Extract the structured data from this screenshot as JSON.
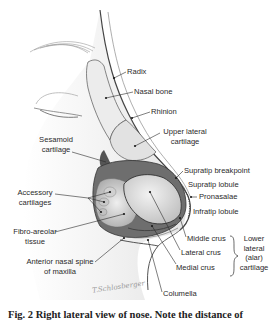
{
  "figure": {
    "caption": "Fig. 2 Right lateral view of nose. Note the distance of",
    "signature": "T.Schlosberger",
    "labels": {
      "radix": "Radix",
      "nasal_bone": "Nasal bone",
      "rhinion": "Rhinion",
      "upper_lateral_1": "Upper lateral",
      "upper_lateral_2": "cartilage",
      "sesamoid_1": "Sesamoid",
      "sesamoid_2": "cartilage",
      "supratip_breakpoint": "Supratip breakpoint",
      "supratip_lobule": "Supratip lobule",
      "pronasalae": "Pronasalae",
      "infratip_lobule": "Infratip lobule",
      "accessory_1": "Accessory",
      "accessory_2": "cartilages",
      "fibro_1": "Fibro-areolar",
      "fibro_2": "tissue",
      "middle_crus": "Middle crus",
      "lateral_crus": "Lateral crus",
      "medial_crus": "Medial crus",
      "lower_lateral_1": "Lower",
      "lower_lateral_2": "lateral",
      "lower_lateral_3": "(alar)",
      "lower_lateral_4": "cartilage",
      "ans_1": "Anterior nasal spine",
      "ans_2": "of maxilla",
      "columella": "Columella"
    },
    "colors": {
      "background": "#ffffff",
      "skin": "#e8e8e8",
      "shadow": "#8a8a8a",
      "line": "#2a2a2a",
      "cartilage": "#d6d6d6"
    }
  }
}
